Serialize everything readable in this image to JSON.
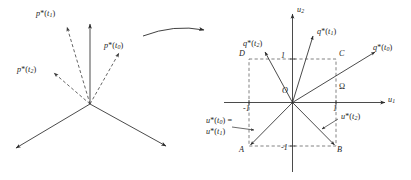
{
  "figure": {
    "transition_arrow": "curved-arrow-right",
    "stroke_color": "#2b2b2b",
    "dash_color": "#4a4a4a"
  },
  "left_panel": {
    "name": "costate-vector-cone",
    "origin_label": "",
    "dashed_vectors": [
      {
        "id": "p-t1",
        "label_p": "p",
        "star": "*",
        "paren_open": "(",
        "arg": "t",
        "index": "1",
        "paren_close": ")"
      },
      {
        "id": "p-t0",
        "label_p": "p",
        "star": "*",
        "paren_open": "(",
        "arg": "t",
        "index": "0",
        "paren_close": ")"
      },
      {
        "id": "p-t2",
        "label_p": "p",
        "star": "*",
        "paren_open": "(",
        "arg": "t",
        "index": "2",
        "paren_close": ")"
      }
    ],
    "labels": {
      "p_t1": "p*(t1)",
      "p_t0": "p*(t0)",
      "p_t2": "p*(t2)"
    },
    "solid_rays": 3
  },
  "right_panel": {
    "name": "control-constraint-square",
    "axes": {
      "x_label_base": "u",
      "x_label_sub": "1",
      "y_label_base": "u",
      "y_label_sub": "2"
    },
    "origin_label": "O",
    "ticks": {
      "x_pos": "1",
      "x_neg": "-1",
      "y_pos": "1",
      "y_neg": "-1"
    },
    "region_label": "Ω",
    "corners": {
      "top_left": "D",
      "top_right": "C",
      "bottom_left": "A",
      "bottom_right": "B"
    },
    "q_vectors": {
      "q_t2": {
        "base": "q",
        "star": "*",
        "arg": "t",
        "index": "2"
      },
      "q_t1": {
        "base": "q",
        "star": "*",
        "arg": "t",
        "index": "1"
      },
      "q_t0": {
        "base": "q",
        "star": "*",
        "arg": "t",
        "index": "0"
      }
    },
    "u_labels": {
      "u_t0_line1_base": "u",
      "u_t0_line1_index": "0",
      "u_t0_line1_suffix": "=",
      "u_t1_line2_base": "u",
      "u_t1_line2_index": "1",
      "u_t2_base": "u",
      "u_t2_index": "2"
    }
  }
}
